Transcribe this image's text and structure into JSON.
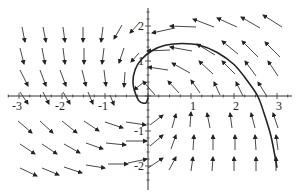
{
  "chart_data": {
    "type": "direction_field",
    "title": "",
    "xlabel": "",
    "ylabel": "",
    "xlim": [
      -3.3,
      3.4
    ],
    "ylim": [
      -2.6,
      2.5
    ],
    "grid": false,
    "legend": null,
    "x_ticks": [
      {
        "value": -3,
        "label": "-3"
      },
      {
        "value": -2,
        "label": "-2"
      },
      {
        "value": -1,
        "label": "-1"
      },
      {
        "value": 1,
        "label": "1"
      },
      {
        "value": 2,
        "label": "2"
      },
      {
        "value": 3,
        "label": "3"
      }
    ],
    "y_ticks": [
      {
        "value": 2,
        "label": "2"
      },
      {
        "value": 1,
        "label": "1"
      },
      {
        "value": -1,
        "label": "-1"
      },
      {
        "value": -2,
        "label": "-2"
      }
    ],
    "trajectory": {
      "description": "solution curve starting near origin, looping left then arcing over to cross x-axis near 2.5 and descending",
      "points": [
        [
          0.0,
          -0.05
        ],
        [
          -0.05,
          -0.2
        ],
        [
          -0.2,
          -0.15
        ],
        [
          -0.3,
          0.1
        ],
        [
          -0.35,
          0.4
        ],
        [
          -0.3,
          0.75
        ],
        [
          -0.15,
          1.05
        ],
        [
          0.1,
          1.3
        ],
        [
          0.4,
          1.45
        ],
        [
          0.8,
          1.5
        ],
        [
          1.2,
          1.45
        ],
        [
          1.6,
          1.25
        ],
        [
          2.0,
          0.9
        ],
        [
          2.3,
          0.45
        ],
        [
          2.55,
          0.0
        ],
        [
          2.7,
          -0.5
        ],
        [
          2.85,
          -1.1
        ],
        [
          2.95,
          -1.7
        ],
        [
          3.0,
          -2.05
        ]
      ]
    },
    "arrows": [
      [
        22,
        27,
        25,
        42
      ],
      [
        43,
        27,
        46,
        42
      ],
      [
        63,
        27,
        65,
        42
      ],
      [
        83,
        27,
        83,
        42
      ],
      [
        103,
        27,
        101,
        42
      ],
      [
        122,
        25,
        114,
        39
      ],
      [
        140,
        22,
        130,
        33
      ],
      [
        20,
        48,
        24,
        64
      ],
      [
        42,
        48,
        45,
        64
      ],
      [
        63,
        48,
        65,
        64
      ],
      [
        84,
        48,
        84,
        64
      ],
      [
        104,
        48,
        102,
        64
      ],
      [
        124,
        48,
        119,
        63
      ],
      [
        139,
        53,
        131,
        62
      ],
      [
        20,
        70,
        28,
        86
      ],
      [
        40,
        70,
        46,
        86
      ],
      [
        60,
        70,
        66,
        86
      ],
      [
        82,
        70,
        86,
        86
      ],
      [
        104,
        70,
        106,
        86
      ],
      [
        125,
        72,
        124,
        87
      ],
      [
        144,
        82,
        134,
        90
      ],
      [
        20,
        92,
        28,
        104
      ],
      [
        43,
        92,
        49,
        104
      ],
      [
        63,
        92,
        70,
        104
      ],
      [
        88,
        92,
        93,
        104
      ],
      [
        110,
        95,
        114,
        105
      ],
      [
        18,
        121,
        32,
        133
      ],
      [
        40,
        121,
        53,
        133
      ],
      [
        62,
        121,
        77,
        133
      ],
      [
        84,
        121,
        99,
        131
      ],
      [
        105,
        122,
        123,
        128
      ],
      [
        126,
        122,
        146,
        125
      ],
      [
        20,
        144,
        35,
        154
      ],
      [
        42,
        144,
        57,
        154
      ],
      [
        64,
        144,
        80,
        153
      ],
      [
        86,
        143,
        103,
        149
      ],
      [
        106,
        143,
        126,
        145
      ],
      [
        126,
        141,
        147,
        141
      ],
      [
        20,
        168,
        37,
        176
      ],
      [
        42,
        168,
        59,
        175
      ],
      [
        64,
        167,
        82,
        173
      ],
      [
        86,
        165,
        105,
        168
      ],
      [
        108,
        164,
        128,
        164
      ],
      [
        128,
        163,
        147,
        159
      ],
      [
        175,
        28,
        152,
        33
      ],
      [
        196,
        27,
        170,
        26
      ],
      [
        214,
        27,
        193,
        19
      ],
      [
        237,
        27,
        217,
        18
      ],
      [
        260,
        28,
        241,
        17
      ],
      [
        282,
        27,
        263,
        15
      ],
      [
        170,
        50,
        147,
        51
      ],
      [
        192,
        51,
        170,
        47
      ],
      [
        215,
        55,
        197,
        44
      ],
      [
        238,
        54,
        222,
        41
      ],
      [
        258,
        57,
        242,
        41
      ],
      [
        280,
        57,
        265,
        42
      ],
      [
        168,
        70,
        148,
        67
      ],
      [
        190,
        73,
        172,
        63
      ],
      [
        213,
        74,
        199,
        61
      ],
      [
        235,
        74,
        222,
        61
      ],
      [
        256,
        76,
        245,
        61
      ],
      [
        278,
        76,
        268,
        61
      ],
      [
        155,
        95,
        143,
        81
      ],
      [
        179,
        93,
        168,
        81
      ],
      [
        200,
        93,
        191,
        80
      ],
      [
        220,
        95,
        214,
        82
      ],
      [
        243,
        96,
        236,
        82
      ],
      [
        266,
        95,
        258,
        82
      ],
      [
        150,
        125,
        163,
        115
      ],
      [
        172,
        128,
        176,
        114
      ],
      [
        190,
        127,
        191,
        112
      ],
      [
        210,
        128,
        207,
        113
      ],
      [
        232,
        128,
        230,
        113
      ],
      [
        255,
        128,
        251,
        113
      ],
      [
        278,
        128,
        273,
        113
      ],
      [
        150,
        146,
        163,
        135
      ],
      [
        171,
        149,
        176,
        135
      ],
      [
        193,
        150,
        194,
        135
      ],
      [
        213,
        150,
        213,
        135
      ],
      [
        235,
        150,
        235,
        135
      ],
      [
        256,
        150,
        255,
        135
      ],
      [
        278,
        150,
        276,
        135
      ],
      [
        148,
        168,
        163,
        158
      ],
      [
        169,
        170,
        176,
        157
      ],
      [
        191,
        171,
        193,
        157
      ],
      [
        212,
        171,
        213,
        157
      ],
      [
        234,
        171,
        234,
        157
      ],
      [
        256,
        171,
        256,
        157
      ],
      [
        276,
        171,
        276,
        157
      ]
    ]
  }
}
